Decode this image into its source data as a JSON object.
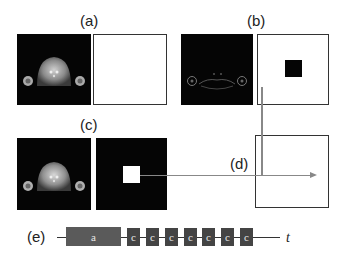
{
  "panels": {
    "a": {
      "label": "(a)",
      "mri_type": "full-intensity",
      "mask": "empty"
    },
    "b": {
      "label": "(b)",
      "mri_type": "edge-only",
      "mask": "black-square-on-white"
    },
    "c": {
      "label": "(c)",
      "mri_type": "full-intensity",
      "mask": "white-square-on-black"
    },
    "d": {
      "label": "(d)",
      "mask": "empty-with-crosshair-arrows"
    }
  },
  "timeline": {
    "label": "(e)",
    "axis_label": "t",
    "blocks": [
      {
        "text": "a",
        "kind": "a"
      },
      {
        "text": "c",
        "kind": "c"
      },
      {
        "text": "c",
        "kind": "c"
      },
      {
        "text": "c",
        "kind": "c"
      },
      {
        "text": "c",
        "kind": "c"
      },
      {
        "text": "c",
        "kind": "c"
      },
      {
        "text": "c",
        "kind": "c"
      },
      {
        "text": "c",
        "kind": "c"
      }
    ]
  },
  "colors": {
    "block_a": "#5a5a5a",
    "block_c": "#444444",
    "connector": "#888888",
    "border": "#333333"
  }
}
